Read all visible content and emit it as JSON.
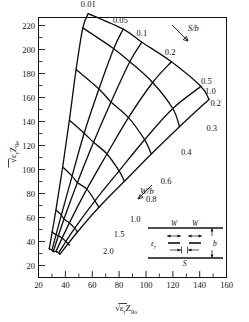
{
  "figure": {
    "domain": "chart",
    "background_color": "#ffffff",
    "ink_color": "#111111"
  },
  "chart_data": {
    "type": "line",
    "title": "",
    "subtitle": "",
    "xlabel": "√ε_r Z_0o",
    "ylabel": "√ε_r Z_0e",
    "xlabel_parts": {
      "radical": "√",
      "eps": "ε",
      "eps_sub": "r",
      "z": "Z",
      "z_sub": "0o"
    },
    "ylabel_parts": {
      "radical": "√",
      "eps": "ε",
      "eps_sub": "r",
      "z": "Z",
      "z_sub": "0e"
    },
    "xlim": [
      20,
      160
    ],
    "ylim": [
      20,
      220
    ],
    "x_major_ticks": [
      20,
      40,
      60,
      80,
      100,
      120,
      140,
      160
    ],
    "y_major_ticks": [
      20,
      40,
      60,
      80,
      100,
      120,
      140,
      160,
      180,
      200,
      220
    ],
    "x_major_step": 20,
    "y_major_step": 20,
    "x_minor_step": 10,
    "y_minor_step": 10,
    "grid": false,
    "legend_position": "none",
    "family_a": {
      "name": "S/b",
      "label": "S/b",
      "annotation_arrow": "down-right",
      "values": [
        "0.01",
        "0.05",
        "0.1",
        "0.2",
        "0.5",
        "1.0"
      ],
      "curves": [
        {
          "value": "0.01",
          "label_xy": [
            57,
            228
          ],
          "points": [
            [
              28,
              42
            ],
            [
              33,
              72
            ],
            [
              38,
              105
            ],
            [
              43,
              141
            ],
            [
              48,
              180
            ],
            [
              53,
              212
            ],
            [
              57,
              223
            ]
          ]
        },
        {
          "value": "0.05",
          "label_xy": [
            81,
            216
          ],
          "points": [
            [
              30,
              41
            ],
            [
              37,
              68
            ],
            [
              45,
              98
            ],
            [
              54,
              131
            ],
            [
              65,
              165
            ],
            [
              76,
              196
            ],
            [
              83,
              211
            ]
          ]
        },
        {
          "value": "0.1",
          "label_xy": [
            97,
            206
          ],
          "points": [
            [
              31,
              40
            ],
            [
              39,
              65
            ],
            [
              49,
              93
            ],
            [
              61,
              124
            ],
            [
              74,
              155
            ],
            [
              88,
              186
            ],
            [
              97,
              201
            ]
          ]
        },
        {
          "value": "0.2",
          "label_xy": [
            118,
            191
          ],
          "points": [
            [
              33,
              40
            ],
            [
              43,
              62
            ],
            [
              56,
              88
            ],
            [
              71,
              115
            ],
            [
              87,
              143
            ],
            [
              105,
              170
            ],
            [
              119,
              186
            ]
          ]
        },
        {
          "value": "0.5",
          "label_xy": [
            145,
            169
          ],
          "points": [
            [
              35,
              39
            ],
            [
              47,
              58
            ],
            [
              62,
              79
            ],
            [
              80,
              102
            ],
            [
              99,
              126
            ],
            [
              120,
              150
            ],
            [
              141,
              167
            ]
          ]
        },
        {
          "value": "1.0",
          "label_xy": [
            148,
            161
          ],
          "points": [
            [
              36,
              38
            ],
            [
              49,
              55
            ],
            [
              65,
              74
            ],
            [
              84,
              94
            ],
            [
              104,
              115
            ],
            [
              125,
              136
            ],
            [
              147,
              157
            ]
          ]
        }
      ]
    },
    "family_b": {
      "name": "W/b",
      "label": "W/b",
      "annotation_arrow": "up-right",
      "values": [
        "0.2",
        "0.3",
        "0.4",
        "0.6",
        "0.8",
        "1.0",
        "1.5",
        "2.0"
      ],
      "curves": [
        {
          "value": "0.2",
          "label_xy": [
            152,
            152
          ],
          "points": [
            [
              57,
              223
            ],
            [
              83,
              211
            ],
            [
              97,
              201
            ],
            [
              119,
              186
            ],
            [
              141,
              167
            ],
            [
              147,
              157
            ]
          ]
        },
        {
          "value": "0.3",
          "label_xy": [
            149,
            133
          ],
          "points": [
            [
              53,
              212
            ],
            [
              76,
              196
            ],
            [
              88,
              186
            ],
            [
              105,
              170
            ],
            [
              120,
              150
            ],
            [
              125,
              136
            ]
          ]
        },
        {
          "value": "0.4",
          "label_xy": [
            130,
            114
          ],
          "points": [
            [
              48,
              180
            ],
            [
              65,
              165
            ],
            [
              74,
              155
            ],
            [
              87,
              143
            ],
            [
              99,
              126
            ],
            [
              104,
              115
            ]
          ]
        },
        {
          "value": "0.6",
          "label_xy": [
            115,
            92
          ],
          "points": [
            [
              43,
              141
            ],
            [
              54,
              131
            ],
            [
              61,
              124
            ],
            [
              71,
              115
            ],
            [
              80,
              102
            ],
            [
              84,
              94
            ]
          ]
        },
        {
          "value": "0.8",
          "label_xy": [
            104,
            78
          ],
          "points": [
            [
              38,
              105
            ],
            [
              45,
              98
            ],
            [
              49,
              93
            ],
            [
              56,
              88
            ],
            [
              62,
              79
            ],
            [
              65,
              74
            ]
          ]
        },
        {
          "value": "1.0",
          "label_xy": [
            92,
            63
          ],
          "points": [
            [
              33,
              72
            ],
            [
              37,
              68
            ],
            [
              39,
              65
            ],
            [
              43,
              62
            ],
            [
              47,
              58
            ],
            [
              49,
              55
            ]
          ]
        },
        {
          "value": "1.5",
          "label_xy": [
            80,
            51
          ],
          "points": [
            [
              30,
              55
            ],
            [
              33,
              53
            ],
            [
              35,
              52
            ],
            [
              38,
              50
            ],
            [
              41,
              47
            ],
            [
              43,
              45
            ]
          ]
        },
        {
          "value": "2.0",
          "label_xy": [
            72,
            38
          ],
          "points": [
            [
              28,
              42
            ],
            [
              30,
              41
            ],
            [
              31,
              40
            ],
            [
              33,
              40
            ],
            [
              35,
              39
            ],
            [
              36,
              38
            ]
          ]
        }
      ]
    }
  },
  "annotations": {
    "sb_label": "S/b",
    "wb_label": "W/b"
  },
  "inset": {
    "name": "coupled-stripline-cross-section",
    "labels": {
      "strip_left": "W",
      "strip_right": "W",
      "gap": "S",
      "height": "b",
      "dielectric": "ε",
      "dielectric_sub": "r"
    }
  }
}
